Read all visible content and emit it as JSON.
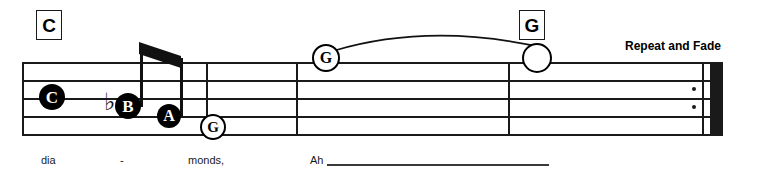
{
  "sheet": {
    "width": 773,
    "height": 181,
    "background": "#ffffff",
    "ink_color": "#1a1a1a"
  },
  "chord_symbols": [
    {
      "label": "C",
      "x": 36,
      "y": 10,
      "w": 24,
      "h": 28,
      "font_size": 19
    },
    {
      "label": "G",
      "x": 519,
      "y": 10,
      "w": 24,
      "h": 28,
      "font_size": 19
    }
  ],
  "staff": {
    "x": 22,
    "right": 723,
    "line_ys": [
      62,
      80,
      98,
      116,
      134
    ],
    "line_thickness": 2
  },
  "barlines": [
    {
      "name": "barline-opening",
      "x": 22,
      "width": 2.4
    },
    {
      "name": "barline-measure-1",
      "x": 206,
      "width": 2.4
    },
    {
      "name": "barline-measure-2",
      "x": 296,
      "width": 2.4
    },
    {
      "name": "barline-measure-3",
      "x": 508,
      "width": 2.4
    },
    {
      "name": "barline-repeat-thin",
      "x": 702,
      "width": 2.4
    }
  ],
  "repeat_end": {
    "thick_x": 710,
    "thick_width": 13,
    "dot_x": 692,
    "dot_ys": [
      89,
      107
    ]
  },
  "notes": [
    {
      "name": "note-c",
      "letter": "C",
      "style": "filled",
      "cx": 52,
      "cy": 97,
      "r": 13,
      "font_size": 17
    },
    {
      "name": "note-b-flat",
      "letter": "B",
      "style": "filled",
      "cx": 128,
      "cy": 106,
      "r": 13,
      "font_size": 17
    },
    {
      "name": "note-a",
      "letter": "A",
      "style": "filled",
      "cx": 169,
      "cy": 116,
      "r": 12,
      "font_size": 16
    },
    {
      "name": "note-g-low",
      "letter": "G",
      "style": "circled",
      "cx": 211,
      "cy": 125,
      "r": 11,
      "font_size": 15
    },
    {
      "name": "note-g-slur-start",
      "letter": "G",
      "style": "circled",
      "cx": 324,
      "cy": 56,
      "r": 12,
      "font_size": 16
    },
    {
      "name": "note-g-whole",
      "letter": "",
      "style": "open",
      "cx": 535,
      "cy": 56,
      "r": 13,
      "font_size": 0
    }
  ],
  "accidentals": [
    {
      "name": "flat-sign-b",
      "glyph": "♭",
      "x": 104,
      "y": 90,
      "font_size": 24
    }
  ],
  "stems": [
    {
      "name": "stem-b-flat",
      "x": 140,
      "top": 48,
      "bottom": 107
    },
    {
      "name": "stem-a",
      "x": 180,
      "top": 58,
      "bottom": 117
    }
  ],
  "beam": {
    "name": "eighth-note-beam",
    "points": "139,42 181,56 181,68 139,54",
    "color": "#111111"
  },
  "slur": {
    "name": "slur-g-to-g",
    "path": "M 333 51 Q 430 22 545 48",
    "color": "#111111",
    "width": 1.8
  },
  "lyrics": [
    {
      "name": "lyric-dia",
      "text": "dia",
      "x": 41,
      "y": 155,
      "font_size": 11
    },
    {
      "name": "lyric-hyphen",
      "text": "-",
      "x": 120,
      "y": 155,
      "font_size": 11
    },
    {
      "name": "lyric-monds",
      "text": "monds,",
      "x": 188,
      "y": 155,
      "font_size": 11
    },
    {
      "name": "lyric-ah",
      "text": "Ah",
      "x": 310,
      "y": 155,
      "font_size": 11
    }
  ],
  "lyric_extender": {
    "name": "lyric-extender-ah",
    "x": 327,
    "y": 164,
    "width": 222
  },
  "directions": [
    {
      "name": "repeat-and-fade-text",
      "text": "Repeat and Fade",
      "x": 625,
      "y": 40,
      "font_size": 12
    }
  ]
}
